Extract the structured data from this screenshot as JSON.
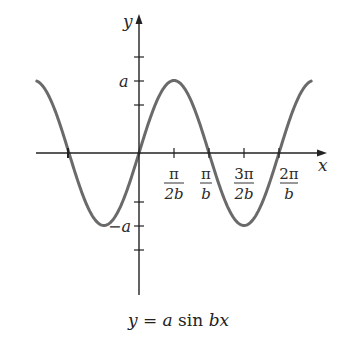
{
  "chart_data": {
    "type": "line",
    "title": "",
    "caption": "y = a sin bx",
    "function": "y = a sin(bx)",
    "xlabel": "x",
    "ylabel": "y",
    "x_ticks": [
      {
        "value": "-π/b",
        "label": ""
      },
      {
        "value": "π/(2b)",
        "label_num": "π",
        "label_den": "2b"
      },
      {
        "value": "π/b",
        "label_num": "π",
        "label_den": "b"
      },
      {
        "value": "3π/(2b)",
        "label_num": "3π",
        "label_den": "2b"
      },
      {
        "value": "2π/b",
        "label_num": "2π",
        "label_den": "b"
      }
    ],
    "y_ticks": [
      {
        "value": "a",
        "label": "a"
      },
      {
        "value": "-a",
        "label": "−a"
      }
    ],
    "xlim_in_units_of_pi_over_b": [
      -1.46,
      2.46
    ],
    "ylim_in_units_of_a": [
      -2,
      2
    ],
    "series": [
      {
        "name": "a sin bx",
        "x_units": "π/b",
        "x": [
          -1.46,
          -1.0,
          -0.5,
          0,
          0.5,
          1.0,
          1.5,
          2.0,
          2.46
        ],
        "y_units": "a",
        "y": [
          0.99,
          0,
          -1,
          0,
          1,
          0,
          -1,
          0,
          0.99
        ],
        "color": "#6a6a6a"
      }
    ],
    "grid": false,
    "legend": "none"
  },
  "labels": {
    "y_axis": "y",
    "x_axis": "x",
    "a": "a",
    "neg_a": "−a",
    "tick1_num": "π",
    "tick1_den": "2b",
    "tick2_num": "π",
    "tick2_den": "b",
    "tick3_num": "3π",
    "tick3_den": "2b",
    "tick4_num": "2π",
    "tick4_den": "b"
  },
  "caption": {
    "y": "y",
    "eq": " = ",
    "a": "a",
    "sin": " sin ",
    "bx": "bx"
  },
  "colors": {
    "axis": "#222222",
    "curve": "#6a6a6a",
    "text": "#2b2b2b"
  }
}
